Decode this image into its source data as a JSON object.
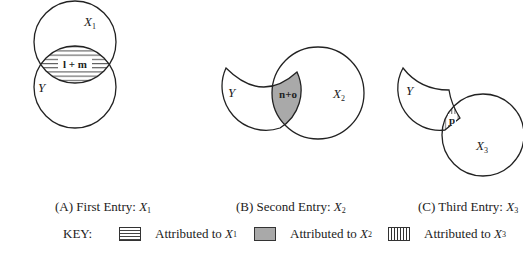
{
  "panels": [
    {
      "id": "A",
      "caption_prefix": "(A) First Entry: ",
      "caption_var": "X",
      "caption_sub": "1",
      "circle_labels": [
        {
          "var": "X",
          "sub": "1"
        },
        {
          "var": "Y",
          "sub": ""
        }
      ],
      "region_label": "l + m",
      "region_fill": "horizontal-hatch"
    },
    {
      "id": "B",
      "caption_prefix": "(B) Second Entry: ",
      "caption_var": "X",
      "caption_sub": "2",
      "circle_labels": [
        {
          "var": "Y",
          "sub": ""
        },
        {
          "var": "X",
          "sub": "2"
        }
      ],
      "region_label": "n+o",
      "region_fill": "gray"
    },
    {
      "id": "C",
      "caption_prefix": "(C) Third Entry: ",
      "caption_var": "X",
      "caption_sub": "3",
      "circle_labels": [
        {
          "var": "Y",
          "sub": ""
        },
        {
          "var": "X",
          "sub": "3"
        }
      ],
      "region_label": "p",
      "region_fill": "vertical-hatch"
    }
  ],
  "key": {
    "label": "KEY:",
    "items": [
      {
        "text": "Attributed to ",
        "var": "X",
        "sub": "1",
        "swatch": "horizontal-hatch"
      },
      {
        "text": "Attributed to ",
        "var": "X",
        "sub": "2",
        "swatch": "gray"
      },
      {
        "text": "Attributed to ",
        "var": "X",
        "sub": "3",
        "swatch": "vertical-hatch"
      }
    ]
  },
  "colors": {
    "stroke": "#222222",
    "gray_fill": "#a9a9a9",
    "background": "#ffffff"
  }
}
